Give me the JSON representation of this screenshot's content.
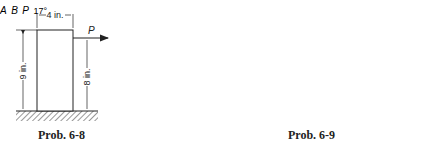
{
  "figure_left": {
    "caption": "Prob. 6-8",
    "width_label": "4 in.",
    "height_label": "9 in.",
    "force_height_label": "8 in.",
    "force_label": "P"
  },
  "figure_right": {
    "caption": "Prob. 6-9",
    "block_a_label": "A",
    "block_b_label": "B",
    "force_label": "P",
    "angle_label": "17°"
  },
  "colors": {
    "line": "#222222",
    "background": "#ffffff"
  }
}
